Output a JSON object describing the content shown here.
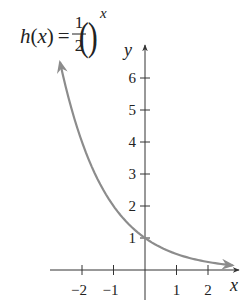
{
  "chart_data": {
    "type": "line",
    "title_parts": {
      "func": "h",
      "lparen": "(",
      "var": "x",
      "rparen": ")",
      "equals": "=",
      "numerator": "1",
      "denominator": "2",
      "exponent": "x"
    },
    "xlabel": "x",
    "ylabel": "y",
    "xlim": [
      -3,
      3
    ],
    "ylim": [
      -0.6,
      7
    ],
    "x_ticks": [
      -2,
      -1,
      1,
      2
    ],
    "x_tick_labels": [
      "−2",
      "−1",
      "1",
      "2"
    ],
    "y_ticks": [
      1,
      2,
      3,
      4,
      5,
      6
    ],
    "y_tick_labels": [
      "1",
      "2",
      "3",
      "4",
      "5",
      "6"
    ],
    "grid": false,
    "legend": null,
    "series": [
      {
        "name": "h(x) = (1/2)^x",
        "color": "#8c8c8c",
        "x": [
          -2.7,
          -2.5,
          -2,
          -1.5,
          -1,
          -0.5,
          0,
          0.5,
          1,
          1.5,
          2,
          2.5,
          2.78
        ],
        "y": [
          6.5,
          5.66,
          4,
          2.83,
          2,
          1.41,
          1,
          0.71,
          0.5,
          0.35,
          0.25,
          0.18,
          0.15
        ],
        "arrows": "both"
      }
    ]
  },
  "colors": {
    "axis": "#333333",
    "curve": "#8c8c8c",
    "text": "#222222"
  }
}
